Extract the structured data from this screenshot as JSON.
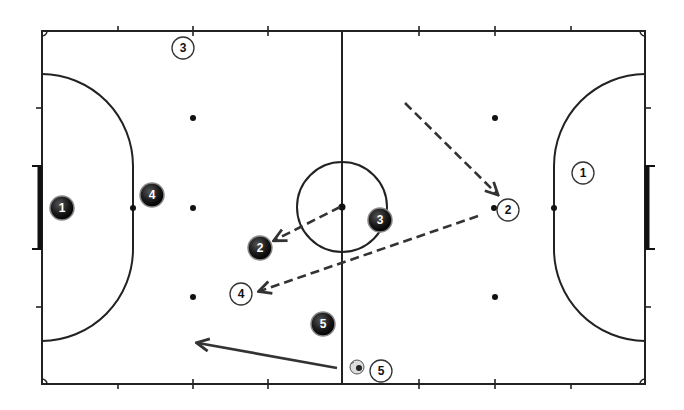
{
  "diagram": {
    "colors": {
      "line": "#222222",
      "arrow": "#333333",
      "background": "#ffffff",
      "team_dark": "#1a1a1a",
      "team_light": "#ffffff"
    },
    "court": {
      "left": 42,
      "top": 31,
      "right": 645,
      "bottom": 384,
      "center_x": 342,
      "center_y": 207
    },
    "players_dark": [
      {
        "id": "dark-1",
        "label": "1",
        "x": 62,
        "y": 208
      },
      {
        "id": "dark-4",
        "label": "4",
        "x": 152,
        "y": 195
      },
      {
        "id": "dark-2",
        "label": "2",
        "x": 260,
        "y": 248
      },
      {
        "id": "dark-3",
        "label": "3",
        "x": 380,
        "y": 220
      },
      {
        "id": "dark-5",
        "label": "5",
        "x": 323,
        "y": 324
      }
    ],
    "players_light": [
      {
        "id": "light-3",
        "label": "3",
        "x": 183,
        "y": 48
      },
      {
        "id": "light-1",
        "label": "1",
        "x": 583,
        "y": 173
      },
      {
        "id": "light-2",
        "label": "2",
        "x": 508,
        "y": 210
      },
      {
        "id": "light-4",
        "label": "4",
        "x": 241,
        "y": 294
      },
      {
        "id": "light-5",
        "label": "5",
        "x": 381,
        "y": 371
      }
    ],
    "ball": {
      "x": 357,
      "y": 367
    },
    "arrows": [
      {
        "id": "pass-center-to-2",
        "type": "dashed",
        "x1": 340,
        "y1": 207,
        "x2": 275,
        "y2": 240
      },
      {
        "id": "run-to-light-2",
        "type": "dashed",
        "x1": 405,
        "y1": 103,
        "x2": 497,
        "y2": 194
      },
      {
        "id": "pass-to-light-4",
        "type": "dashed",
        "x1": 478,
        "y1": 216,
        "x2": 260,
        "y2": 291
      },
      {
        "id": "run-solid-left",
        "type": "solid",
        "x1": 337,
        "y1": 368,
        "x2": 198,
        "y2": 343
      }
    ]
  }
}
